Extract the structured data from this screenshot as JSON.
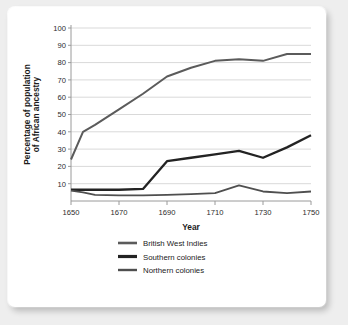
{
  "chart_data": {
    "type": "line",
    "title": "",
    "xlabel": "Year",
    "ylabel": "Percentage of population of African ancestry",
    "ylabel_line1": "Percentage of population",
    "ylabel_line2": "of African ancestry",
    "x": [
      1650,
      1655,
      1660,
      1670,
      1680,
      1690,
      1700,
      1710,
      1720,
      1730,
      1740,
      1750
    ],
    "xlim": [
      1650,
      1750
    ],
    "ylim": [
      0,
      100
    ],
    "ytick_labels": [
      "10",
      "20",
      "30",
      "40",
      "50",
      "60",
      "70",
      "80",
      "90",
      "100"
    ],
    "yticks": [
      10,
      20,
      30,
      40,
      50,
      60,
      70,
      80,
      90,
      100
    ],
    "xtick_labels": [
      "1650",
      "1670",
      "1690",
      "1710",
      "1730",
      "1750"
    ],
    "xticks": [
      1650,
      1670,
      1690,
      1710,
      1730,
      1750
    ],
    "grid": "horizontal",
    "legend_position": "bottom",
    "series": [
      {
        "name": "British West Indies",
        "color": "#5b5b5b",
        "width": 2.0,
        "values": [
          24,
          40,
          44,
          53,
          62,
          72,
          77,
          81,
          82,
          81,
          85,
          85
        ]
      },
      {
        "name": "Southern colonies",
        "color": "#232323",
        "width": 2.3,
        "values": [
          6.5,
          6.5,
          6.5,
          6.5,
          7,
          23,
          25,
          27,
          29,
          25,
          31,
          38
        ]
      },
      {
        "name": "Northern colonies",
        "color": "#4f4f4f",
        "width": 1.8,
        "values": [
          6,
          5,
          3.5,
          3.2,
          3.2,
          3.5,
          4,
          4.5,
          9,
          5.5,
          4.5,
          5.5
        ]
      }
    ]
  },
  "legend": {
    "entries": [
      {
        "label": "British West Indies",
        "color": "#5b5b5b",
        "width": 2.6
      },
      {
        "label": "Southern colonies",
        "color": "#232323",
        "width": 3.2
      },
      {
        "label": "Northern colonies",
        "color": "#4f4f4f",
        "width": 2.4
      }
    ]
  }
}
